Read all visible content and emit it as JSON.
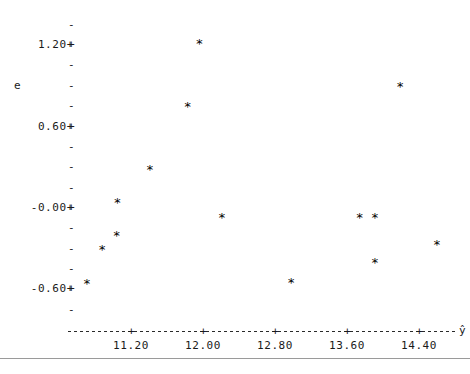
{
  "chart_data": {
    "type": "scatter",
    "title": "",
    "xlabel": "ŷ",
    "ylabel": "e",
    "xlim": [
      10.55,
      14.9
    ],
    "ylim": [
      -0.78,
      1.33
    ],
    "grid": false,
    "legend": null,
    "marker": "*",
    "marker_color": "#000000",
    "x_ticks": [
      "11.20",
      "12.00",
      "12.80",
      "13.60",
      "14.40"
    ],
    "x_tick_values": [
      11.2,
      12.0,
      12.8,
      13.6,
      14.4
    ],
    "y_ticks": [
      "1.20+",
      "0.60+",
      "-0.00+",
      "-0.60+"
    ],
    "y_tick_values": [
      1.2,
      0.6,
      0.0,
      -0.6
    ],
    "y_minor_tick_count_between": 3,
    "points": [
      {
        "x": 10.71,
        "y": -0.57
      },
      {
        "x": 10.88,
        "y": -0.32
      },
      {
        "x": 11.04,
        "y": -0.21
      },
      {
        "x": 11.05,
        "y": 0.03
      },
      {
        "x": 11.41,
        "y": 0.27
      },
      {
        "x": 11.83,
        "y": 0.74
      },
      {
        "x": 11.96,
        "y": 1.2
      },
      {
        "x": 12.21,
        "y": -0.08
      },
      {
        "x": 12.98,
        "y": -0.56
      },
      {
        "x": 13.74,
        "y": -0.08
      },
      {
        "x": 13.91,
        "y": -0.08
      },
      {
        "x": 13.91,
        "y": -0.41
      },
      {
        "x": 14.19,
        "y": 0.88
      },
      {
        "x": 14.6,
        "y": -0.28
      }
    ]
  },
  "axis": {
    "y_label_text": "e",
    "x_label_text": "ŷ",
    "tick_glyph_major": "+",
    "tick_glyph_minor": "-"
  }
}
